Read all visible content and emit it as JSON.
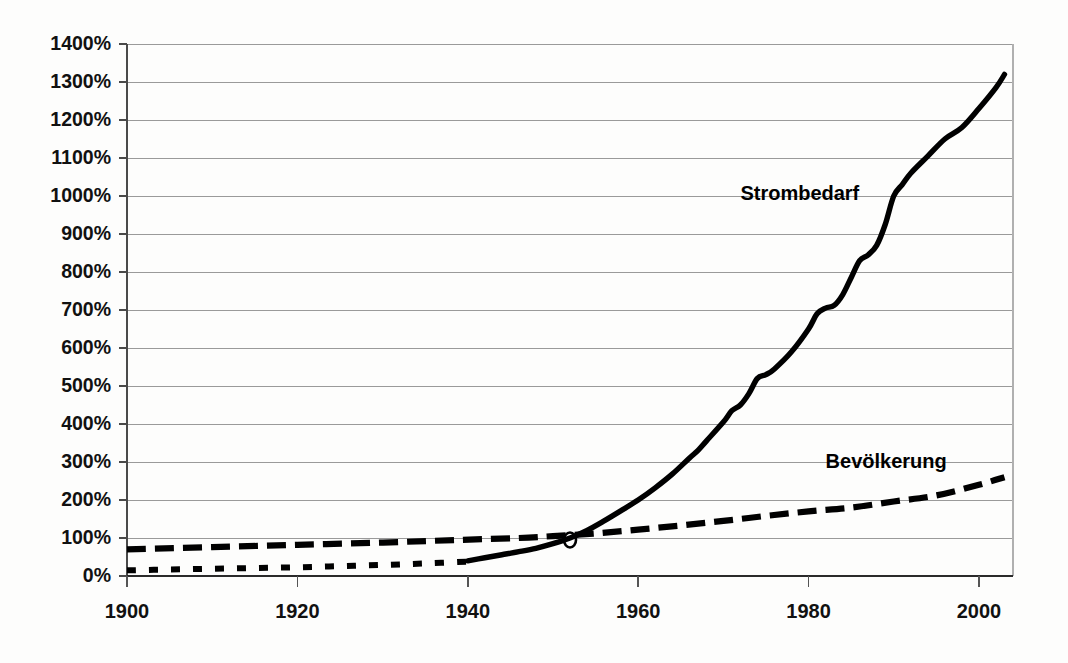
{
  "chart_data": {
    "type": "line",
    "title": "",
    "subtitle": "",
    "xlabel": "",
    "ylabel": "",
    "xlim": [
      1900,
      2004
    ],
    "ylim": [
      0,
      1400
    ],
    "grid": true,
    "grid_axis": "y",
    "legend_position": "inline-annotations",
    "y_tick_labels": [
      "1400%",
      "1300%",
      "1200%",
      "1100%",
      "1000%",
      "900%",
      "800%",
      "700%",
      "600%",
      "500%",
      "400%",
      "300%",
      "200%",
      "100%",
      "0%"
    ],
    "y_tick_values": [
      1400,
      1300,
      1200,
      1100,
      1000,
      900,
      800,
      700,
      600,
      500,
      400,
      300,
      200,
      100,
      0
    ],
    "x_tick_labels": [
      "1900",
      "1920",
      "1940",
      "1960",
      "1980",
      "2000"
    ],
    "x_tick_values": [
      1900,
      1920,
      1940,
      1960,
      1980,
      2000
    ],
    "annotations": [
      {
        "text": "Strombedarf",
        "x": 1972,
        "y": 990
      },
      {
        "text": "Bevölkerung",
        "x": 1982,
        "y": 285
      }
    ],
    "series": [
      {
        "name": "Strombedarf",
        "label": "Strombedarf",
        "style": "solid",
        "color": "#000000",
        "x": [
          1940,
          1942,
          1944,
          1946,
          1948,
          1950,
          1952,
          1954,
          1956,
          1958,
          1960,
          1962,
          1964,
          1966,
          1967,
          1968,
          1970,
          1971,
          1972,
          1973,
          1974,
          1975,
          1976,
          1978,
          1980,
          1981,
          1982,
          1983,
          1984,
          1985,
          1986,
          1987,
          1988,
          1989,
          1990,
          1991,
          1992,
          1994,
          1996,
          1998,
          2000,
          2002,
          2003
        ],
        "y": [
          40,
          48,
          56,
          64,
          73,
          85,
          100,
          120,
          145,
          172,
          200,
          232,
          268,
          310,
          330,
          355,
          405,
          435,
          450,
          480,
          520,
          530,
          545,
          590,
          650,
          690,
          705,
          712,
          740,
          785,
          830,
          845,
          870,
          925,
          1000,
          1030,
          1060,
          1105,
          1150,
          1180,
          1230,
          1285,
          1320
        ]
      },
      {
        "name": "Bevölkerung",
        "label": "Bevölkerung",
        "style": "dashed",
        "color": "#000000",
        "x": [
          1900,
          1910,
          1920,
          1930,
          1939,
          1946,
          1950,
          1955,
          1960,
          1965,
          1970,
          1975,
          1980,
          1985,
          1990,
          1995,
          2000,
          2003
        ],
        "y": [
          70,
          76,
          82,
          88,
          95,
          100,
          105,
          112,
          122,
          133,
          145,
          158,
          170,
          180,
          196,
          212,
          240,
          260
        ]
      },
      {
        "name": "Vergleichsreihe",
        "label": "",
        "style": "dotted",
        "color": "#000000",
        "x": [
          1900,
          1905,
          1910,
          1915,
          1920,
          1925,
          1930,
          1935,
          1940
        ],
        "y": [
          15,
          17,
          19,
          21,
          23,
          26,
          29,
          33,
          38
        ]
      }
    ],
    "markers": [
      {
        "series": "Strombedarf",
        "x": 1952,
        "y": 100,
        "shape": "circle-outline"
      }
    ]
  },
  "axes": {
    "y_axis_name": "percent-axis",
    "x_axis_name": "year-axis"
  }
}
